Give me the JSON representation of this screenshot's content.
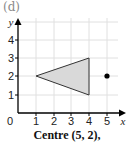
{
  "part_label": "(d)",
  "caption": "Centre (5, 2),",
  "axes": {
    "x_label": "x",
    "y_label": "y",
    "origin_label": "0",
    "x_ticks": [
      "1",
      "2",
      "3",
      "4",
      "5"
    ],
    "y_ticks": [
      "1",
      "2",
      "3",
      "4"
    ]
  },
  "shapes": {
    "triangle": {
      "vertices": [
        [
          1,
          2
        ],
        [
          4,
          3
        ],
        [
          4,
          1
        ]
      ],
      "fill": "#d9d9d9",
      "stroke": "#333333"
    },
    "centre_point": {
      "x": 5,
      "y": 2,
      "color": "#000000"
    }
  },
  "grid": {
    "x_range": [
      0,
      5.5
    ],
    "y_range": [
      0,
      4.5
    ],
    "color": "#e0e0e0"
  }
}
